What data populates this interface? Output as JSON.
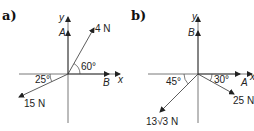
{
  "diagrams": [
    {
      "part_label": "a)",
      "axis_x": "x",
      "axis_y": "y",
      "vectors": [
        {
          "label": "A",
          "direction": "along +y"
        },
        {
          "label": "B",
          "direction": "along +x"
        },
        {
          "label": "4 N",
          "angle_label": "60°",
          "direction": "60° above +x axis"
        },
        {
          "label": "15 N",
          "angle_label": "25°",
          "direction": "25° below -x axis"
        }
      ]
    },
    {
      "part_label": "b)",
      "axis_x": "x",
      "axis_y": "y",
      "vectors": [
        {
          "label": "B",
          "direction": "along +y"
        },
        {
          "label": "A",
          "direction": "along +x"
        },
        {
          "label": "25 N",
          "angle_label": "30°",
          "direction": "30° below +x axis"
        },
        {
          "label": "13√3 N",
          "angle_label": "45°",
          "direction": "45° below -x axis"
        }
      ]
    }
  ],
  "text": {
    "a_part": "a)",
    "a_y": "y",
    "a_x": "x",
    "a_A": "A",
    "a_B": "B",
    "a_4N": "4 N",
    "a_60": "60°",
    "a_25": "25°",
    "a_15N": "15 N",
    "b_part": "b)",
    "b_y": "y",
    "b_x": "x",
    "b_A": "A",
    "b_B": "B",
    "b_25N": "25 N",
    "b_30": "30°",
    "b_45": "45°",
    "b_13": "13",
    "b_sqrt3": "√3",
    "b_N": " N"
  }
}
